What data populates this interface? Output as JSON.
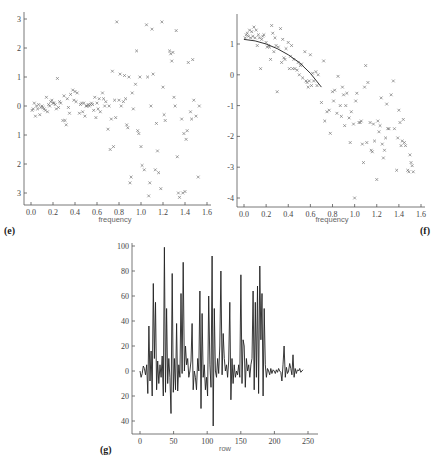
{
  "chart_data": [
    {
      "id": "e",
      "type": "scatter",
      "panel_label": "(e)",
      "xlabel": "frequency",
      "ylabel": "",
      "xlim": [
        0.0,
        1.6
      ],
      "ylim": [
        -3,
        3
      ],
      "xticks": [
        "0.0",
        "0.2",
        "0.4",
        "0.6",
        "0.8",
        "1.0",
        "1.2",
        "1.4",
        "1.6"
      ],
      "yticks": [
        "3",
        "2",
        "1",
        "0",
        "1",
        "2",
        "3"
      ],
      "ytick_values": [
        3,
        2,
        1,
        0,
        -1,
        -2,
        -3
      ],
      "marker": "x",
      "grid": false,
      "points": [
        [
          0.01,
          -0.15
        ],
        [
          0.02,
          -0.1
        ],
        [
          0.03,
          0.1
        ],
        [
          0.04,
          -0.35
        ],
        [
          0.05,
          0.0
        ],
        [
          0.06,
          -0.1
        ],
        [
          0.07,
          0.05
        ],
        [
          0.08,
          -0.3
        ],
        [
          0.09,
          -0.05
        ],
        [
          0.1,
          0.0
        ],
        [
          0.11,
          -0.05
        ],
        [
          0.12,
          -0.1
        ],
        [
          0.13,
          -0.15
        ],
        [
          0.14,
          0.3
        ],
        [
          0.15,
          -0.2
        ],
        [
          0.16,
          0.05
        ],
        [
          0.17,
          0.0
        ],
        [
          0.18,
          0.15
        ],
        [
          0.19,
          0.2
        ],
        [
          0.2,
          0.1
        ],
        [
          0.21,
          0.1
        ],
        [
          0.22,
          0.05
        ],
        [
          0.23,
          -0.1
        ],
        [
          0.24,
          0.95
        ],
        [
          0.25,
          -0.05
        ],
        [
          0.26,
          0.15
        ],
        [
          0.27,
          0.1
        ],
        [
          0.29,
          -0.5
        ],
        [
          0.3,
          0.35
        ],
        [
          0.31,
          -0.5
        ],
        [
          0.32,
          -0.65
        ],
        [
          0.33,
          0.25
        ],
        [
          0.34,
          -0.05
        ],
        [
          0.35,
          -0.25
        ],
        [
          0.36,
          0.4
        ],
        [
          0.38,
          0.55
        ],
        [
          0.39,
          0.2
        ],
        [
          0.4,
          0.5
        ],
        [
          0.41,
          0.15
        ],
        [
          0.42,
          0.45
        ],
        [
          0.44,
          -0.25
        ],
        [
          0.45,
          0.05
        ],
        [
          0.46,
          0.1
        ],
        [
          0.47,
          -0.2
        ],
        [
          0.48,
          0.1
        ],
        [
          0.49,
          -0.35
        ],
        [
          0.5,
          0.0
        ],
        [
          0.51,
          0.0
        ],
        [
          0.52,
          0.05
        ],
        [
          0.53,
          0.0
        ],
        [
          0.54,
          0.05
        ],
        [
          0.55,
          0.1
        ],
        [
          0.56,
          0.05
        ],
        [
          0.57,
          -0.15
        ],
        [
          0.58,
          0.3
        ],
        [
          0.59,
          -0.4
        ],
        [
          0.6,
          0.1
        ],
        [
          0.61,
          -0.1
        ],
        [
          0.62,
          0.25
        ],
        [
          0.63,
          -0.2
        ],
        [
          0.65,
          0.45
        ],
        [
          0.66,
          0.25
        ],
        [
          0.67,
          0.0
        ],
        [
          0.68,
          0.15
        ],
        [
          0.7,
          -0.8
        ],
        [
          0.71,
          0.0
        ],
        [
          0.72,
          -1.5
        ],
        [
          0.73,
          -0.45
        ],
        [
          0.74,
          1.2
        ],
        [
          0.75,
          -1.4
        ],
        [
          0.76,
          0.2
        ],
        [
          0.77,
          -0.4
        ],
        [
          0.78,
          2.9
        ],
        [
          0.8,
          0.2
        ],
        [
          0.81,
          1.1
        ],
        [
          0.82,
          0.0
        ],
        [
          0.84,
          0.15
        ],
        [
          0.85,
          1.05
        ],
        [
          0.86,
          0.25
        ],
        [
          0.87,
          -0.65
        ],
        [
          0.88,
          -0.75
        ],
        [
          0.89,
          1.0
        ],
        [
          0.9,
          -2.65
        ],
        [
          0.91,
          -2.45
        ],
        [
          0.92,
          0.45
        ],
        [
          0.93,
          -0.1
        ],
        [
          0.95,
          0.75
        ],
        [
          0.96,
          1.9
        ],
        [
          0.97,
          -0.85
        ],
        [
          0.98,
          -0.95
        ],
        [
          0.99,
          1.0
        ],
        [
          1.0,
          -1.4
        ],
        [
          1.01,
          -2.05
        ],
        [
          1.03,
          -2.2
        ],
        [
          1.05,
          2.8
        ],
        [
          1.06,
          1.0
        ],
        [
          1.07,
          -3.1
        ],
        [
          1.08,
          -2.65
        ],
        [
          1.09,
          0.0
        ],
        [
          1.1,
          2.65
        ],
        [
          1.11,
          1.1
        ],
        [
          1.13,
          -2.2
        ],
        [
          1.14,
          -0.6
        ],
        [
          1.15,
          -1.55
        ],
        [
          1.16,
          -2.3
        ],
        [
          1.18,
          -2.85
        ],
        [
          1.19,
          2.9
        ],
        [
          1.2,
          0.65
        ],
        [
          1.21,
          -0.3
        ],
        [
          1.22,
          -0.5
        ],
        [
          1.26,
          1.9
        ],
        [
          1.27,
          1.8
        ],
        [
          1.28,
          1.55
        ],
        [
          1.29,
          1.85
        ],
        [
          1.3,
          0.3
        ],
        [
          1.31,
          0.0
        ],
        [
          1.32,
          2.6
        ],
        [
          1.33,
          -1.75
        ],
        [
          1.34,
          -3.0
        ],
        [
          1.35,
          -3.15
        ],
        [
          1.37,
          -0.45
        ],
        [
          1.38,
          -3.0
        ],
        [
          1.39,
          -0.95
        ],
        [
          1.4,
          -2.95
        ],
        [
          1.41,
          -1.15
        ],
        [
          1.42,
          -0.85
        ],
        [
          1.43,
          1.5
        ],
        [
          1.45,
          -0.2
        ],
        [
          1.46,
          -0.45
        ],
        [
          1.47,
          1.6
        ],
        [
          1.48,
          0.2
        ],
        [
          1.5,
          -0.35
        ],
        [
          1.52,
          -2.45
        ],
        [
          1.53,
          0.0
        ]
      ]
    },
    {
      "id": "f",
      "type": "scatter",
      "panel_label": "(f)",
      "xlabel": "frequency",
      "ylabel": "",
      "xlim": [
        0.0,
        1.6
      ],
      "ylim": [
        -4,
        1.6
      ],
      "xticks": [
        "0.0",
        "0.2",
        "0.4",
        "0.6",
        "0.8",
        "1.0",
        "1.2",
        "1.4",
        "1.6"
      ],
      "yticks": [
        "1",
        "0",
        "-1",
        "-2",
        "-3",
        "-4"
      ],
      "ytick_values": [
        1,
        0,
        -1,
        -2,
        -3,
        -4
      ],
      "marker": "x",
      "grid": false,
      "fitted_curve": {
        "x": [
          0.0,
          0.1,
          0.2,
          0.3,
          0.4,
          0.5,
          0.6,
          0.7
        ],
        "y": [
          1.15,
          1.1,
          1.0,
          0.85,
          0.65,
          0.4,
          0.05,
          -0.4
        ]
      },
      "points": [
        [
          0.01,
          1.2
        ],
        [
          0.02,
          1.3
        ],
        [
          0.03,
          1.35
        ],
        [
          0.04,
          1.25
        ],
        [
          0.05,
          1.45
        ],
        [
          0.06,
          1.2
        ],
        [
          0.07,
          1.4
        ],
        [
          0.08,
          1.25
        ],
        [
          0.09,
          1.55
        ],
        [
          0.1,
          1.2
        ],
        [
          0.11,
          1.45
        ],
        [
          0.12,
          0.95
        ],
        [
          0.13,
          1.3
        ],
        [
          0.14,
          1.2
        ],
        [
          0.15,
          0.2
        ],
        [
          0.16,
          1.15
        ],
        [
          0.17,
          1.25
        ],
        [
          0.18,
          1.3
        ],
        [
          0.2,
          1.05
        ],
        [
          0.21,
          0.9
        ],
        [
          0.22,
          0.95
        ],
        [
          0.23,
          0.9
        ],
        [
          0.24,
          0.5
        ],
        [
          0.25,
          1.6
        ],
        [
          0.26,
          1.35
        ],
        [
          0.27,
          0.75
        ],
        [
          0.28,
          1.2
        ],
        [
          0.29,
          0.95
        ],
        [
          0.3,
          -0.55
        ],
        [
          0.31,
          0.9
        ],
        [
          0.33,
          1.5
        ],
        [
          0.34,
          0.4
        ],
        [
          0.35,
          1.15
        ],
        [
          0.36,
          0.55
        ],
        [
          0.37,
          0.5
        ],
        [
          0.38,
          0.85
        ],
        [
          0.4,
          1.05
        ],
        [
          0.41,
          0.2
        ],
        [
          0.42,
          0.6
        ],
        [
          0.43,
          0.95
        ],
        [
          0.44,
          0.2
        ],
        [
          0.45,
          0.5
        ],
        [
          0.46,
          0.2
        ],
        [
          0.48,
          0.15
        ],
        [
          0.49,
          0.4
        ],
        [
          0.5,
          0.0
        ],
        [
          0.51,
          0.3
        ],
        [
          0.52,
          0.35
        ],
        [
          0.53,
          -0.1
        ],
        [
          0.55,
          0.75
        ],
        [
          0.56,
          -0.2
        ],
        [
          0.57,
          -0.25
        ],
        [
          0.58,
          -0.4
        ],
        [
          0.59,
          -0.2
        ],
        [
          0.6,
          0.65
        ],
        [
          0.61,
          -0.35
        ],
        [
          0.62,
          0.05
        ],
        [
          0.63,
          -0.2
        ],
        [
          0.65,
          0.1
        ],
        [
          0.66,
          -0.35
        ],
        [
          0.67,
          0.0
        ],
        [
          0.7,
          -0.9
        ],
        [
          0.72,
          0.45
        ],
        [
          0.73,
          -1.5
        ],
        [
          0.75,
          -1.2
        ],
        [
          0.77,
          -1.15
        ],
        [
          0.78,
          -1.9
        ],
        [
          0.8,
          -0.55
        ],
        [
          0.81,
          -0.85
        ],
        [
          0.82,
          -0.5
        ],
        [
          0.84,
          -1.25
        ],
        [
          0.85,
          -0.05
        ],
        [
          0.87,
          -1.0
        ],
        [
          0.88,
          -1.35
        ],
        [
          0.89,
          -0.4
        ],
        [
          0.9,
          -0.65
        ],
        [
          0.91,
          -1.65
        ],
        [
          0.92,
          -1.0
        ],
        [
          0.93,
          -0.6
        ],
        [
          0.95,
          -1.4
        ],
        [
          0.96,
          -2.2
        ],
        [
          0.97,
          -1.2
        ],
        [
          0.99,
          -1.6
        ],
        [
          1.0,
          -4.0
        ],
        [
          1.01,
          -0.85
        ],
        [
          1.02,
          -0.6
        ],
        [
          1.04,
          -1.55
        ],
        [
          1.05,
          -1.55
        ],
        [
          1.06,
          -1.5
        ],
        [
          1.07,
          -2.25
        ],
        [
          1.08,
          -2.85
        ],
        [
          1.09,
          -0.4
        ],
        [
          1.1,
          0.3
        ],
        [
          1.11,
          -2.2
        ],
        [
          1.12,
          -0.25
        ],
        [
          1.14,
          -1.55
        ],
        [
          1.15,
          -2.45
        ],
        [
          1.16,
          -2.5
        ],
        [
          1.17,
          -1.6
        ],
        [
          1.18,
          -2.15
        ],
        [
          1.2,
          -3.4
        ],
        [
          1.21,
          -1.5
        ],
        [
          1.22,
          -1.85
        ],
        [
          1.23,
          -1.65
        ],
        [
          1.24,
          -0.75
        ],
        [
          1.25,
          -2.25
        ],
        [
          1.26,
          -2.7
        ],
        [
          1.27,
          -2.45
        ],
        [
          1.28,
          -2.05
        ],
        [
          1.29,
          -0.95
        ],
        [
          1.3,
          -1.75
        ],
        [
          1.31,
          -1.75
        ],
        [
          1.33,
          -0.65
        ],
        [
          1.35,
          -0.2
        ],
        [
          1.36,
          -1.75
        ],
        [
          1.38,
          -3.1
        ],
        [
          1.39,
          -2.05
        ],
        [
          1.4,
          -1.15
        ],
        [
          1.41,
          -1.55
        ],
        [
          1.42,
          -2.3
        ],
        [
          1.43,
          -2.15
        ],
        [
          1.44,
          -1.45
        ],
        [
          1.45,
          -2.2
        ],
        [
          1.46,
          -2.3
        ],
        [
          1.48,
          -3.1
        ],
        [
          1.49,
          -3.15
        ],
        [
          1.5,
          -2.6
        ],
        [
          1.51,
          -2.85
        ],
        [
          1.52,
          -2.95
        ],
        [
          1.53,
          -3.15
        ]
      ]
    },
    {
      "id": "g",
      "type": "line",
      "panel_label": "(g)",
      "xlabel": "row",
      "ylabel": "",
      "xlim": [
        0,
        255
      ],
      "ylim": [
        -45,
        100
      ],
      "xticks": [
        "0",
        "50",
        "100",
        "150",
        "200",
        "250"
      ],
      "xtick_values": [
        0,
        50,
        100,
        150,
        200,
        250
      ],
      "yticks": [
        "100",
        "80",
        "60",
        "40",
        "20",
        "0",
        "20",
        "40"
      ],
      "ytick_values": [
        100,
        80,
        60,
        40,
        20,
        0,
        -20,
        -40
      ],
      "grid": false,
      "values": [
        0,
        -5,
        -2,
        4,
        2,
        -3,
        5,
        -18,
        36,
        -8,
        16,
        -20,
        70,
        10,
        55,
        -15,
        8,
        -10,
        5,
        -5,
        12,
        -20,
        99,
        -17,
        50,
        -10,
        10,
        -5,
        -34,
        78,
        -17,
        10,
        -15,
        38,
        -16,
        5,
        -5,
        62,
        -2,
        87,
        0,
        20,
        5,
        10,
        -5,
        0,
        8,
        38,
        -15,
        0,
        -5,
        -15,
        10,
        0,
        64,
        -30,
        46,
        -5,
        5,
        -15,
        -5,
        -20,
        60,
        5,
        -13,
        92,
        -44,
        50,
        0,
        -5,
        10,
        -2,
        20,
        80,
        -3,
        30,
        10,
        0,
        5,
        -5,
        8,
        55,
        -23,
        10,
        -10,
        5,
        -5,
        0,
        -3,
        5,
        -5,
        77,
        -10,
        25,
        20,
        -13,
        10,
        0,
        5,
        -5,
        5,
        10,
        64,
        -15,
        55,
        -5,
        68,
        -18,
        84,
        25,
        62,
        -20,
        50,
        5,
        -5,
        2,
        0,
        -3,
        2,
        -2,
        1,
        0,
        -2,
        1,
        -1,
        2,
        0,
        -1,
        -8,
        5,
        20,
        -5,
        3,
        -2,
        0,
        6,
        2,
        -3,
        13,
        -5,
        2,
        -2,
        1,
        0,
        2,
        -1,
        0,
        1
      ],
      "value_spacing": 1.65
    }
  ]
}
